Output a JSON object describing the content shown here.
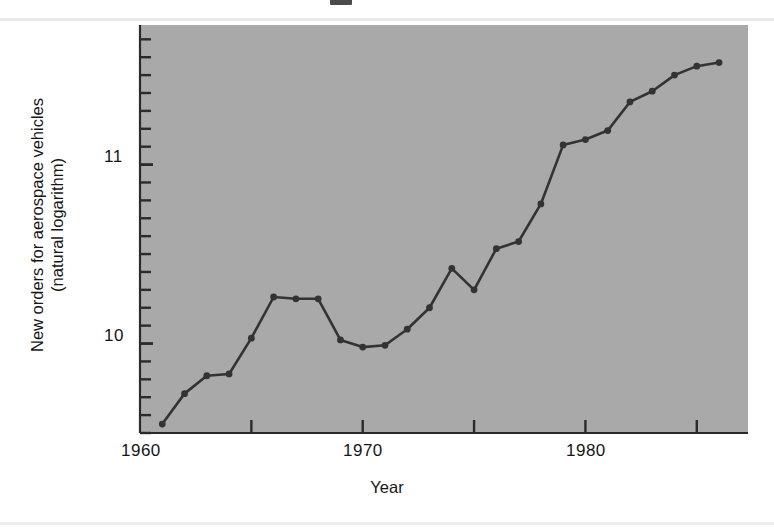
{
  "figure": {
    "background_color": "#ffffff",
    "panel_color": "#a9a9a9",
    "line_color": "#333333"
  },
  "chart_data": {
    "type": "line",
    "title": "",
    "xlabel": "Year",
    "ylabel": "New orders for aerospace vehicles\n(natural logarithm)",
    "ylabel_line1": "New orders for aerospace vehicles",
    "ylabel_line2": "(natural logarithm)",
    "x": [
      1961,
      1962,
      1963,
      1964,
      1965,
      1966,
      1967,
      1968,
      1969,
      1970,
      1971,
      1972,
      1973,
      1974,
      1975,
      1976,
      1977,
      1978,
      1979,
      1980,
      1981,
      1982,
      1983,
      1984,
      1985,
      1986
    ],
    "values": [
      9.55,
      9.72,
      9.82,
      9.83,
      10.03,
      10.26,
      10.25,
      10.25,
      10.02,
      9.98,
      9.99,
      10.08,
      10.2,
      10.42,
      10.3,
      10.53,
      10.57,
      10.78,
      11.11,
      11.14,
      11.19,
      11.35,
      11.41,
      11.5,
      11.55,
      11.57
    ],
    "series": [
      {
        "name": "New orders for aerospace vehicles (natural logarithm)",
        "values": [
          9.55,
          9.72,
          9.82,
          9.83,
          10.03,
          10.26,
          10.25,
          10.25,
          10.02,
          9.98,
          9.99,
          10.08,
          10.2,
          10.42,
          10.3,
          10.53,
          10.57,
          10.78,
          11.11,
          11.14,
          11.19,
          11.35,
          11.41,
          11.5,
          11.55,
          11.57
        ]
      }
    ],
    "xlim": [
      1960,
      1987.3
    ],
    "ylim": [
      9.5,
      11.78
    ],
    "xticks": [
      1960,
      1965,
      1970,
      1975,
      1980,
      1985
    ],
    "xtick_labels": [
      "1960",
      "",
      "1970",
      "",
      "1980",
      ""
    ],
    "xtick_labels_shown": [
      "1960",
      "1970",
      "1980"
    ],
    "yticks_major": [
      10,
      11
    ],
    "ytick_labels": [
      "10",
      "11"
    ],
    "ytick_minor_step": 0.1,
    "grid": false,
    "legend": null,
    "marker": "filled-circle",
    "marker_color": "#333333",
    "line_width": 2.6
  },
  "axes": {
    "y_tick_11": "11",
    "y_tick_10": "10",
    "x_tick_1960": "1960",
    "x_tick_1970": "1970",
    "x_tick_1980": "1980",
    "x_axis_title": "Year",
    "y_axis_title_line1": "New orders for aerospace vehicles",
    "y_axis_title_line2": "(natural logarithm)"
  }
}
